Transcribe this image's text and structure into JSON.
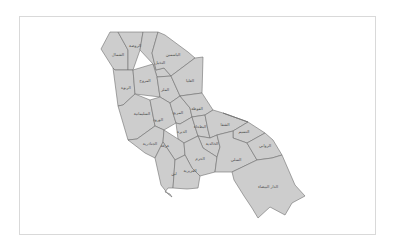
{
  "map": {
    "fill_color": "#cdcdcd",
    "border_color": "#6e6e6e",
    "frame_color": "#d9d9d9",
    "districts": [
      {
        "id": "d1",
        "label": "الشمال",
        "x": 118,
        "y": 56
      },
      {
        "id": "d2",
        "label": "الروضة",
        "x": 135,
        "y": 47
      },
      {
        "id": "d3",
        "label": "النخيل",
        "x": 160,
        "y": 64
      },
      {
        "id": "d4",
        "label": "الياسمين",
        "x": 173,
        "y": 56
      },
      {
        "id": "d5",
        "label": "الربوة",
        "x": 126,
        "y": 89
      },
      {
        "id": "d6",
        "label": "المروج",
        "x": 145,
        "y": 82
      },
      {
        "id": "d7",
        "label": "الملز",
        "x": 165,
        "y": 91
      },
      {
        "id": "d8",
        "label": "العليا",
        "x": 190,
        "y": 82
      },
      {
        "id": "d9",
        "label": "السليمانية",
        "x": 142,
        "y": 115
      },
      {
        "id": "d10",
        "label": "الورود",
        "x": 158,
        "y": 121
      },
      {
        "id": "d11",
        "label": "المربع",
        "x": 178,
        "y": 114
      },
      {
        "id": "d12",
        "label": "الفوطة",
        "x": 197,
        "y": 110
      },
      {
        "id": "d13",
        "label": "الديرة",
        "x": 182,
        "y": 133
      },
      {
        "id": "d14",
        "label": "البطحاء",
        "x": 200,
        "y": 128
      },
      {
        "id": "d15",
        "label": "الشفا",
        "x": 225,
        "y": 126
      },
      {
        "id": "d16",
        "label": "النسيم",
        "x": 244,
        "y": 133
      },
      {
        "id": "d17",
        "label": "الجنادرية",
        "x": 150,
        "y": 145
      },
      {
        "id": "d18",
        "label": "عرقة",
        "x": 165,
        "y": 147
      },
      {
        "id": "d19",
        "label": "الخالدية",
        "x": 212,
        "y": 145
      },
      {
        "id": "d20",
        "label": "الحزم",
        "x": 200,
        "y": 160
      },
      {
        "id": "d21",
        "label": "السلي",
        "x": 236,
        "y": 161
      },
      {
        "id": "d22",
        "label": "الروابي",
        "x": 265,
        "y": 147
      },
      {
        "id": "d23",
        "label": "لبن",
        "x": 174,
        "y": 175
      },
      {
        "id": "d24",
        "label": "العزيزية",
        "x": 190,
        "y": 172
      },
      {
        "id": "d25",
        "label": "الدار البيضاء",
        "x": 268,
        "y": 188
      }
    ]
  }
}
